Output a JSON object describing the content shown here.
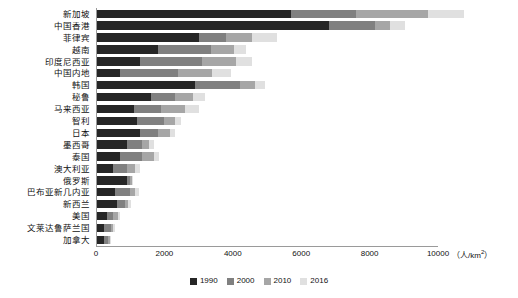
{
  "chart_data": {
    "type": "bar",
    "orientation": "horizontal",
    "stacked": true,
    "title": "",
    "xlabel": "（人/km²）",
    "ylabel": "",
    "xlim": [
      0,
      10000
    ],
    "xticks": [
      0,
      2000,
      4000,
      6000,
      8000,
      10000
    ],
    "xtick_labels": [
      "0",
      "2000",
      "4000",
      "6000",
      "8000",
      "10000"
    ],
    "grid": false,
    "legend_position": "bottom",
    "categories": [
      "新加坡",
      "中国香港",
      "菲律宾",
      "越南",
      "印度尼西亚",
      "中国内地",
      "韩国",
      "秘鲁",
      "马来西亚",
      "智利",
      "日本",
      "墨西哥",
      "泰国",
      "澳大利亚",
      "俄罗斯",
      "巴布亚新几内亚",
      "新西兰",
      "美国",
      "文莱达鲁萨兰国",
      "加拿大"
    ],
    "series": [
      {
        "name": "1990",
        "color": "#262626",
        "values": [
          5700,
          6800,
          3000,
          1800,
          1300,
          700,
          2900,
          1600,
          1100,
          1200,
          1300,
          900,
          700,
          500,
          900,
          550,
          600,
          330,
          230,
          230
        ]
      },
      {
        "name": "2000",
        "color": "#808080",
        "values": [
          1900,
          1350,
          800,
          1550,
          1800,
          1700,
          1300,
          700,
          800,
          800,
          500,
          450,
          650,
          400,
          100,
          450,
          250,
          180,
          200,
          120
        ]
      },
      {
        "name": "2010",
        "color": "#a6a6a6",
        "values": [
          2100,
          450,
          750,
          700,
          1000,
          1000,
          450,
          550,
          700,
          300,
          350,
          200,
          350,
          250,
          50,
          150,
          100,
          120,
          80,
          60
        ]
      },
      {
        "name": "2016",
        "color": "#e0e0e0",
        "values": [
          1050,
          450,
          750,
          350,
          450,
          550,
          300,
          350,
          400,
          200,
          150,
          150,
          150,
          150,
          30,
          100,
          70,
          60,
          50,
          40
        ]
      }
    ]
  },
  "legend": {
    "items": [
      {
        "label": "1990",
        "color": "#262626"
      },
      {
        "label": "2000",
        "color": "#808080"
      },
      {
        "label": "2010",
        "color": "#a6a6a6"
      },
      {
        "label": "2016",
        "color": "#e0e0e0"
      }
    ]
  },
  "axis": {
    "unit_prefix": "（人/km",
    "unit_sup": "2",
    "unit_suffix": "）"
  }
}
